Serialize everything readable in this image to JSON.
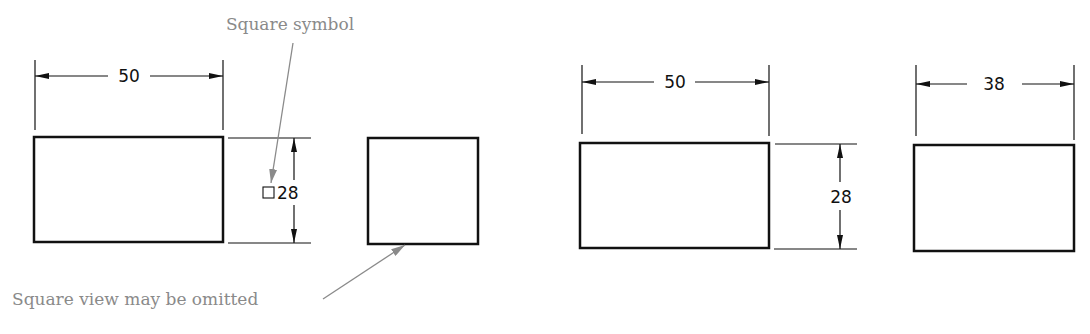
{
  "top_cut_text": "... graph ... the ... ing ...",
  "left_figure": {
    "callout_square_symbol": "Square symbol",
    "callout_omitted": "Square view may be omitted",
    "width_dim": "50",
    "height_dim": "28",
    "square_symbol_glyph": "□"
  },
  "right_figure": {
    "width_dim": "50",
    "height_dim": "28",
    "side_width_dim": "38"
  },
  "colors": {
    "line": "#111111",
    "callout": "#8a8a8a"
  }
}
